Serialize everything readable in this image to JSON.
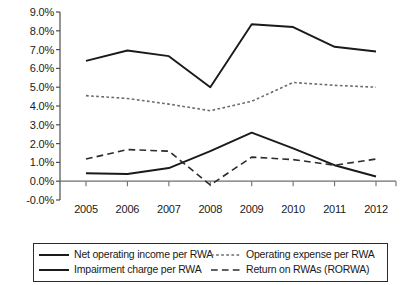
{
  "chart_data": {
    "type": "line",
    "title": "",
    "xlabel": "",
    "ylabel": "",
    "categories": [
      "2005",
      "2006",
      "2007",
      "2008",
      "2009",
      "2010",
      "2011",
      "2012"
    ],
    "x_tick_labels": [
      "2005",
      "2006",
      "2007",
      "2008",
      "2009",
      "2010",
      "2011",
      "2012"
    ],
    "y_tick_labels": [
      "9.0%",
      "8.0%",
      "7.0%",
      "6.0%",
      "5.0%",
      "4.0%",
      "3.0%",
      "2.0%",
      "1.0%",
      "0.0%",
      "-0.0%"
    ],
    "y_tick_values": [
      9.0,
      8.0,
      7.0,
      6.0,
      5.0,
      4.0,
      3.0,
      2.0,
      1.0,
      0.0,
      -1.0
    ],
    "ylim": [
      -1.0,
      9.0
    ],
    "grid": false,
    "legend_position": "bottom",
    "series": [
      {
        "name": "Net operating income per RWA",
        "style": "solid",
        "color": "#1a1a1a",
        "width": 1.9,
        "values": [
          6.4,
          6.95,
          6.65,
          5.0,
          8.35,
          8.2,
          7.15,
          6.9
        ]
      },
      {
        "name": "Operating expense per RWA",
        "style": "dotted",
        "color": "#6b6b6b",
        "width": 1.6,
        "values": [
          4.55,
          4.4,
          4.1,
          3.75,
          4.25,
          5.25,
          5.1,
          5.0
        ]
      },
      {
        "name": "Impairment charge per RWA",
        "style": "solid",
        "color": "#1a1a1a",
        "width": 1.9,
        "values": [
          0.42,
          0.38,
          0.7,
          1.6,
          2.58,
          1.75,
          0.85,
          0.25
        ]
      },
      {
        "name": "Return on RWAs (RORWA)",
        "style": "dashed",
        "color": "#2b2b2b",
        "width": 1.6,
        "values": [
          1.18,
          1.68,
          1.6,
          -0.2,
          1.28,
          1.15,
          0.85,
          1.18
        ]
      }
    ]
  },
  "legend": {
    "entries": [
      {
        "label": "Net operating income per RWA",
        "style": "solid",
        "color": "#1a1a1a"
      },
      {
        "label": "Operating expense per RWA",
        "style": "dotted",
        "color": "#6b6b6b"
      },
      {
        "label": "Impairment charge per RWA",
        "style": "solid",
        "color": "#1a1a1a"
      },
      {
        "label": "Return on RWAs (RORWA)",
        "style": "dashed",
        "color": "#2b2b2b"
      }
    ]
  },
  "axis": {
    "zero_line_color": "#6f6f6f",
    "axis_line_color": "#4d4d4d"
  }
}
